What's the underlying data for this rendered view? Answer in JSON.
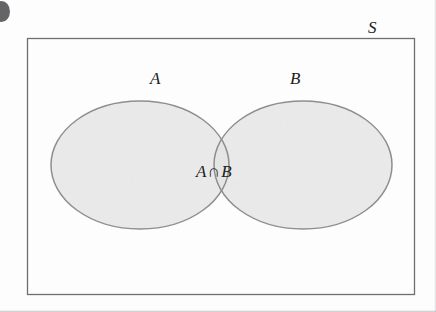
{
  "diagram": {
    "kind": "venn-diagram",
    "title_text": "",
    "universe_label": "S",
    "set_a_label": "A",
    "set_b_label": "B",
    "intersection_label_left": "A",
    "intersection_operator": "∩",
    "intersection_label_right": "B",
    "intersection_label_full": "A ∩ B"
  },
  "colors": {
    "background": "#fdfdfd",
    "region_fill": "#ebebeb",
    "ellipse_stroke": "#8e8e90",
    "rectangle_stroke": "#6f6f71",
    "text": "#222222",
    "artifact": "#58585a"
  },
  "geometry": {
    "universe_rect": {
      "x": 27,
      "y": 38,
      "width": 388,
      "height": 257
    },
    "ellipse_a": {
      "cx": 140,
      "cy": 165,
      "rx": 89,
      "ry": 64
    },
    "ellipse_b": {
      "cx": 303,
      "cy": 165,
      "rx": 89,
      "ry": 64
    },
    "label_a_pos": {
      "x": 150,
      "y": 70
    },
    "label_b_pos": {
      "x": 290,
      "y": 70
    },
    "label_s_pos": {
      "x": 368,
      "y": 19
    },
    "label_intersection_pos": {
      "x": 196,
      "y": 163
    }
  }
}
